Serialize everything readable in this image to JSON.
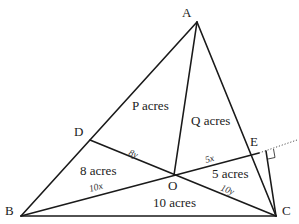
{
  "diagram": {
    "type": "triangle-area-partition",
    "points": {
      "A": {
        "label": "A",
        "x": 197,
        "y": 22
      },
      "B": {
        "label": "B",
        "x": 21,
        "y": 216
      },
      "C": {
        "label": "C",
        "x": 276,
        "y": 216
      },
      "D": {
        "label": "D",
        "x": 90,
        "y": 140
      },
      "E": {
        "label": "E",
        "x": 259,
        "y": 153
      },
      "O": {
        "label": "O",
        "x": 174,
        "y": 175
      },
      "F": {
        "x": 266,
        "y": 151
      }
    },
    "vertex_labels": {
      "A": "A",
      "B": "B",
      "C": "C",
      "D": "D",
      "E": "E",
      "O": "O"
    },
    "regions": {
      "P": "P acres",
      "Q": "Q acres",
      "BOD": "8 acres",
      "BOC": "10 acres",
      "COE": "5 acres"
    },
    "segments": {
      "OD": "8y",
      "BO": "10x",
      "OE": "5x",
      "OC": "10y"
    },
    "extension": {
      "from": "E",
      "dotted_end": {
        "x": 297,
        "y": 140
      },
      "perpendicular_from": "C",
      "right_angle_marker": true
    }
  }
}
